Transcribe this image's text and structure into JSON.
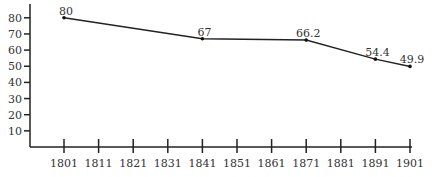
{
  "chart_data": {
    "type": "line",
    "title": "",
    "xlabel": "",
    "ylabel": "",
    "x_ticks": [
      "1801",
      "1811",
      "1821",
      "1831",
      "1841",
      "1851",
      "1861",
      "1871",
      "1881",
      "1891",
      "1901"
    ],
    "y_ticks": [
      "10",
      "20",
      "30",
      "40",
      "50",
      "60",
      "70",
      "80"
    ],
    "ylim": [
      0,
      85
    ],
    "xlim": [
      1801,
      1901
    ],
    "grid": false,
    "series": [
      {
        "name": "series",
        "x": [
          1801,
          1841,
          1871,
          1891,
          1901
        ],
        "values": [
          80,
          67,
          66.2,
          54.4,
          49.9
        ],
        "labels": [
          "80",
          "67",
          "66.2",
          "54.4",
          "49.9"
        ]
      }
    ]
  },
  "colors": {
    "line": "#222222",
    "text": "#333333",
    "background": "#ffffff"
  }
}
